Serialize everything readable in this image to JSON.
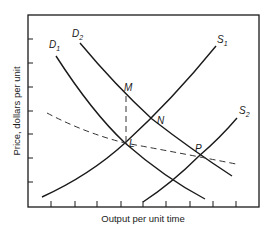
{
  "diagram": {
    "title": "",
    "xlabel": "Output per unit time",
    "ylabel": "Price, dollars per unit",
    "y_tick_count": 7,
    "x_tick_count": 9,
    "curves": [
      {
        "id": "D1",
        "letter": "D",
        "subscript": "1",
        "kind": "demand",
        "style": "solid"
      },
      {
        "id": "D2",
        "letter": "D",
        "subscript": "2",
        "kind": "demand",
        "style": "solid"
      },
      {
        "id": "S1",
        "letter": "S",
        "subscript": "1",
        "kind": "supply",
        "style": "solid"
      },
      {
        "id": "S2",
        "letter": "S",
        "subscript": "2",
        "kind": "supply",
        "style": "solid"
      },
      {
        "id": "LR",
        "kind": "long-run supply",
        "style": "dashed",
        "label": ""
      }
    ],
    "points": [
      {
        "id": "M",
        "label": "M",
        "description": "S1 meets D2 vertically above L"
      },
      {
        "id": "N",
        "label": "N",
        "description": "intersection of S1 and D2"
      },
      {
        "id": "L",
        "label": "L",
        "description": "intersection of S1 and D1 on dashed curve"
      },
      {
        "id": "P",
        "label": "P",
        "description": "intersection of S2 and D2 on dashed curve"
      }
    ],
    "guides": [
      {
        "from": "M",
        "to": "L",
        "style": "dashed",
        "orientation": "vertical"
      }
    ]
  }
}
